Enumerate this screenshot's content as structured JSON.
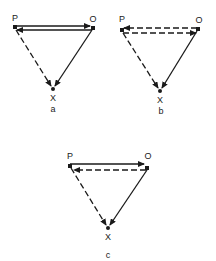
{
  "diagrams": [
    {
      "id": "a",
      "caption": "a",
      "labels": {
        "p": "P",
        "o": "O",
        "x": "X"
      },
      "edges": [
        {
          "from": "P",
          "to": "O",
          "style": "solid"
        },
        {
          "from": "O",
          "to": "P",
          "style": "solid"
        },
        {
          "from": "P",
          "to": "X",
          "style": "dashed"
        },
        {
          "from": "O",
          "to": "X",
          "style": "solid"
        }
      ]
    },
    {
      "id": "b",
      "caption": "b",
      "labels": {
        "p": "P",
        "o": "O",
        "x": "X"
      },
      "edges": [
        {
          "from": "O",
          "to": "P",
          "style": "dashed"
        },
        {
          "from": "P",
          "to": "O",
          "style": "dashed"
        },
        {
          "from": "P",
          "to": "X",
          "style": "dashed"
        },
        {
          "from": "O",
          "to": "X",
          "style": "solid"
        }
      ]
    },
    {
      "id": "c",
      "caption": "c",
      "labels": {
        "p": "P",
        "o": "O",
        "x": "X"
      },
      "edges": [
        {
          "from": "P",
          "to": "O",
          "style": "solid"
        },
        {
          "from": "O",
          "to": "P",
          "style": "dashed"
        },
        {
          "from": "P",
          "to": "X",
          "style": "dashed"
        },
        {
          "from": "O",
          "to": "X",
          "style": "solid"
        }
      ]
    }
  ],
  "colors": {
    "ink": "#1a1a1a",
    "background": "#ffffff"
  }
}
